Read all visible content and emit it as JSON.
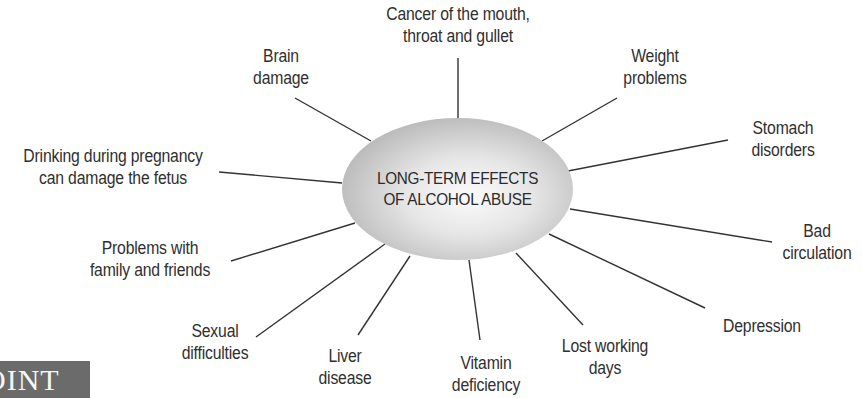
{
  "diagram": {
    "center": {
      "line1": "LONG-TERM EFFECTS",
      "line2": "OF ALCOHOL ABUSE"
    },
    "effects": [
      {
        "id": "cancer",
        "line1": "Cancer of the mouth,",
        "line2": "throat and gullet"
      },
      {
        "id": "weight",
        "line1": "Weight",
        "line2": "problems"
      },
      {
        "id": "stomach",
        "line1": "Stomach",
        "line2": "disorders"
      },
      {
        "id": "circulation",
        "line1": "Bad",
        "line2": "circulation"
      },
      {
        "id": "depression",
        "line1": "Depression",
        "line2": ""
      },
      {
        "id": "lost-work",
        "line1": "Lost working",
        "line2": "days"
      },
      {
        "id": "vitamin",
        "line1": "Vitamin",
        "line2": "deficiency"
      },
      {
        "id": "liver",
        "line1": "Liver",
        "line2": "disease"
      },
      {
        "id": "sexual",
        "line1": "Sexual",
        "line2": "difficulties"
      },
      {
        "id": "family",
        "line1": "Problems with",
        "line2": "family and friends"
      },
      {
        "id": "pregnancy",
        "line1": "Drinking during pregnancy",
        "line2": "can damage the fetus"
      },
      {
        "id": "brain",
        "line1": "Brain",
        "line2": "damage"
      }
    ]
  },
  "badge": {
    "text": "OINT",
    "color": "#6b6b6b"
  },
  "colors": {
    "line": "#333333",
    "text": "#2f2f2f"
  }
}
